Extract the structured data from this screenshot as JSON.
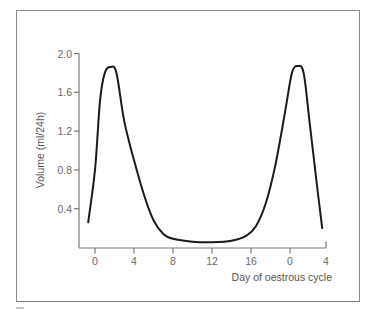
{
  "chart_data": {
    "type": "line",
    "title": "",
    "xlabel": "Day of oestrous cycle",
    "ylabel": "Volume (ml/24h)",
    "x_tick_labels": [
      "0",
      "4",
      "8",
      "12",
      "16",
      "0",
      "4"
    ],
    "x_tick_positions": [
      0,
      4,
      8,
      12,
      16,
      20,
      24
    ],
    "y_tick_labels": [
      "0.4",
      "0.8",
      "1.2",
      "1.6",
      "2.0"
    ],
    "y_ticks": [
      0.4,
      0.8,
      1.2,
      1.6,
      2.0
    ],
    "ylim": [
      0,
      2.0
    ],
    "xlim": [
      -1.5,
      24
    ],
    "grid": false,
    "legend": null,
    "series": [
      {
        "name": "Volume",
        "color": "#1a1a1a",
        "x": [
          -0.7,
          0,
          0.5,
          1,
          1.6,
          2.2,
          3,
          4,
          5,
          6,
          7,
          8,
          10,
          12,
          14,
          15.5,
          16.5,
          17.5,
          18.5,
          19.5,
          20.2,
          20.8,
          21.4,
          22,
          22.7,
          23.3
        ],
        "values": [
          0.26,
          0.8,
          1.5,
          1.8,
          1.86,
          1.8,
          1.3,
          0.9,
          0.55,
          0.28,
          0.14,
          0.09,
          0.06,
          0.055,
          0.07,
          0.12,
          0.22,
          0.45,
          0.85,
          1.4,
          1.8,
          1.87,
          1.8,
          1.3,
          0.7,
          0.2
        ]
      }
    ]
  }
}
